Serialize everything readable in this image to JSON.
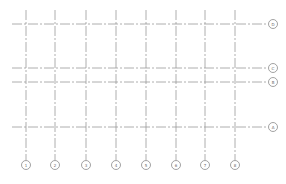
{
  "drawing": {
    "type": "structural grid plan",
    "line_color": "#9a9a9a",
    "bubble_stroke": "#8a8a8a",
    "vertical_grids": [
      {
        "label": "1",
        "x": 26
      },
      {
        "label": "2",
        "x": 55
      },
      {
        "label": "3",
        "x": 86
      },
      {
        "label": "4",
        "x": 116
      },
      {
        "label": "5",
        "x": 146
      },
      {
        "label": "6",
        "x": 176
      },
      {
        "label": "7",
        "x": 205
      },
      {
        "label": "8",
        "x": 235
      }
    ],
    "vertical_extent": {
      "top": 10,
      "bottom": 160,
      "bubble_y": 165
    },
    "horizontal_grids": [
      {
        "label": "D",
        "y": 24
      },
      {
        "label": "C",
        "y": 68
      },
      {
        "label": "B",
        "y": 82
      },
      {
        "label": "A",
        "y": 127
      }
    ],
    "horizontal_extent": {
      "left": 12,
      "right": 268,
      "bubble_x": 273
    },
    "bubble_radius": 4.5
  }
}
